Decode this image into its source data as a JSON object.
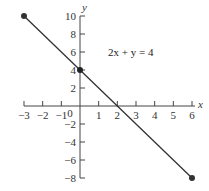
{
  "chart_data": {
    "type": "line",
    "title": "",
    "xlabel": "x",
    "ylabel": "y",
    "xlim": [
      -3,
      6
    ],
    "ylim": [
      -8,
      10
    ],
    "grid": false,
    "x_ticks": [
      -3,
      -2,
      -1,
      0,
      1,
      2,
      3,
      4,
      5,
      6
    ],
    "y_ticks": [
      -8,
      -6,
      -4,
      -2,
      2,
      4,
      6,
      8,
      10
    ],
    "x_tick_labels": [
      "−3",
      "−2",
      "−1",
      "0",
      "1",
      "2",
      "3",
      "4",
      "5",
      "6"
    ],
    "y_tick_labels": [
      "−8",
      "−6",
      "−4",
      "−2",
      "2",
      "4",
      "6",
      "8",
      "10"
    ],
    "series": [
      {
        "name": "2x + y = 4",
        "x": [
          -3,
          6
        ],
        "y": [
          10,
          -8
        ],
        "color": "#333333"
      }
    ],
    "points": [
      {
        "x": -3,
        "y": 10,
        "label": "endpoint"
      },
      {
        "x": 0,
        "y": 4,
        "label": "y-intercept"
      },
      {
        "x": 6,
        "y": -8,
        "label": "endpoint"
      }
    ],
    "annotations": [
      {
        "text": "2x + y = 4",
        "x": 2.2,
        "y": 6
      }
    ]
  },
  "labels": {
    "x_axis": "x",
    "y_axis": "y",
    "equation": "2x + y = 4",
    "x0": "0"
  }
}
